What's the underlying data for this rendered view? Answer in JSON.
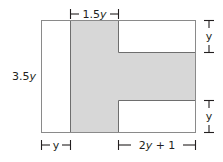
{
  "figure": {
    "type": "geometry-diagram",
    "colors": {
      "shaded_fill": "#d6d6d6",
      "outline": "#808080",
      "inner_outline": "#6b6b6b",
      "dimension_line": "#231f20",
      "background": "#ffffff"
    },
    "outer_rect": {
      "width_label": "",
      "height_label": "3.5y"
    },
    "dimensions": {
      "top": {
        "label": "1.5y",
        "name": "top-dimension-1-5y"
      },
      "left": {
        "label": "3.5y",
        "name": "left-dimension-3-5y"
      },
      "bottom_left": {
        "label": "y",
        "name": "bottom-left-dimension-y"
      },
      "bottom_right": {
        "label": "2y + 1",
        "name": "bottom-right-dimension-2y-plus-1"
      },
      "right_top": {
        "label": "y",
        "name": "right-top-dimension-y"
      },
      "right_bottom": {
        "label": "y",
        "name": "right-bottom-dimension-y"
      }
    },
    "label_parts": {
      "top_num": "1.5",
      "top_var": "y",
      "left_num": "3.5",
      "left_var": "y",
      "bottom_left_var": "y",
      "bottom_right_coef": "2",
      "bottom_right_var": "y",
      "bottom_right_tail": " + 1",
      "right_top_var": "y",
      "right_bottom_var": "y"
    }
  }
}
